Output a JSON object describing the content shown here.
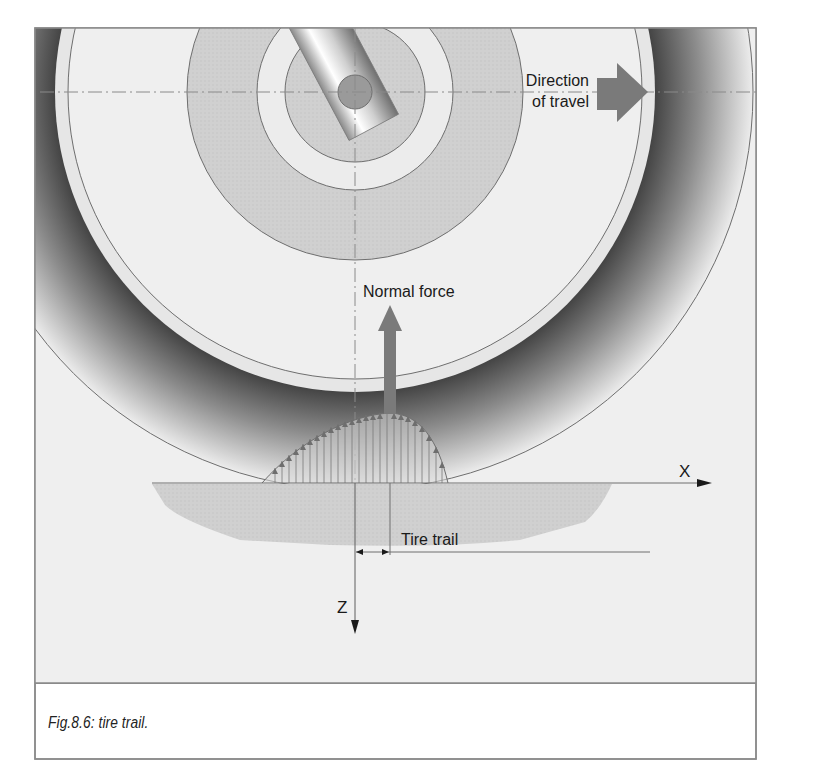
{
  "figure": {
    "caption": "Fig.8.6: tire trail.",
    "labels": {
      "direction_line1": "Direction",
      "direction_line2": "of travel",
      "normal_force": "Normal force",
      "tire_trail": "Tire trail",
      "x_axis": "X",
      "z_axis": "Z"
    },
    "colors": {
      "background": "#efefef",
      "frame": "#8a8a8a",
      "arrow_fill": "#7a7a7a",
      "outline": "#6e6e6e",
      "road_fill": "#cfcfcf",
      "gray_disc": "#d2d2d2",
      "hub": "#9a9a9a"
    }
  }
}
